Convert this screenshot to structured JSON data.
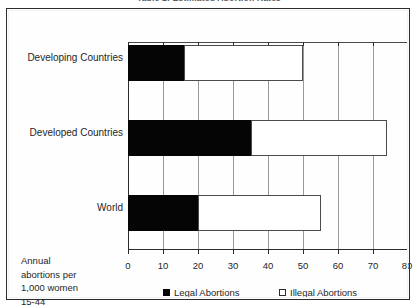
{
  "title": "Table 1: Estimated Abortion Rates",
  "caption": {
    "line1": "Annual",
    "line2": "abortions per",
    "line3": "1,000 women",
    "line4": "15-44"
  },
  "legend": {
    "items": [
      {
        "label": "Legal Abortions",
        "swatch": "black-square-icon",
        "color": "#050505"
      },
      {
        "label": "Illegal Abortions",
        "swatch": "white-square-icon",
        "color": "#ffffff"
      }
    ]
  },
  "chart_data": {
    "type": "bar",
    "orientation": "horizontal",
    "stacked": true,
    "title": "Table 1: Estimated Abortion Rates",
    "xlabel": "Annual abortions per 1,000 women 15-44",
    "ylabel": "",
    "xlim": [
      0,
      80
    ],
    "xticks": [
      0,
      10,
      20,
      30,
      40,
      50,
      60,
      70,
      80
    ],
    "xticklabels": [
      "0",
      "10",
      "20",
      "30",
      "40",
      "50",
      "60",
      "70",
      "80"
    ],
    "grid": true,
    "legend_position": "bottom",
    "categories": [
      "Developing Countries",
      "Developed Countries",
      "World"
    ],
    "series": [
      {
        "name": "Legal Abortions",
        "color": "#050505",
        "values": [
          16,
          35,
          20
        ]
      },
      {
        "name": "Illegal Abortions",
        "color": "#ffffff",
        "values": [
          34,
          39,
          35
        ]
      }
    ],
    "totals": [
      50,
      74,
      55
    ]
  }
}
